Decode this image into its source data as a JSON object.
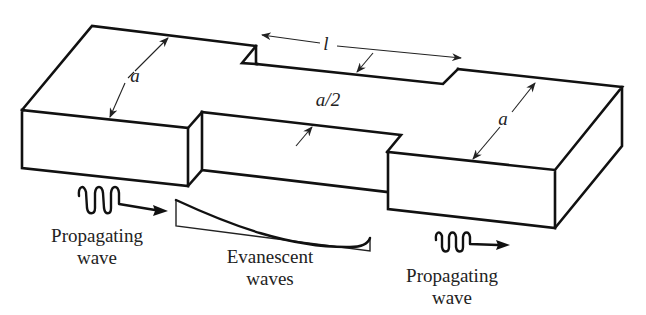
{
  "figure": {
    "dimension_labels": {
      "left_width": "a",
      "right_width": "a",
      "narrow_width": "a/2",
      "section_length": "l"
    },
    "annotations": {
      "left_wave_line1": "Propagating",
      "left_wave_line2": "wave",
      "middle_line1": "Evanescent",
      "middle_line2": "waves",
      "right_wave_line1": "Propagating",
      "right_wave_line2": "wave"
    },
    "colors": {
      "line": "#111111",
      "background": "#ffffff",
      "text": "#222222"
    }
  }
}
